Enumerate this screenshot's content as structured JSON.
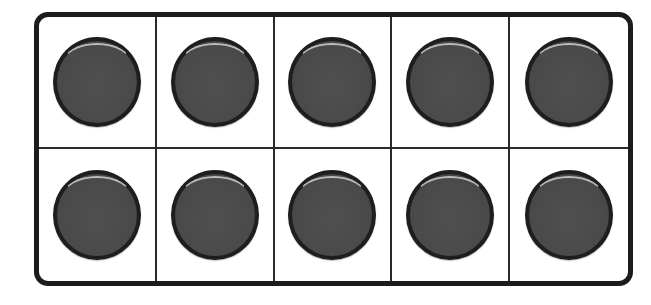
{
  "ten_frame": {
    "rows": 2,
    "columns": 5,
    "filled_count": 10,
    "total_cells": 10,
    "counter_color": "#4a4a4a",
    "counter_border_color": "#1e1e1e",
    "frame_border_color": "#1c1c1c",
    "cells": [
      {
        "row": 1,
        "col": 1,
        "filled": true
      },
      {
        "row": 1,
        "col": 2,
        "filled": true
      },
      {
        "row": 1,
        "col": 3,
        "filled": true
      },
      {
        "row": 1,
        "col": 4,
        "filled": true
      },
      {
        "row": 1,
        "col": 5,
        "filled": true
      },
      {
        "row": 2,
        "col": 1,
        "filled": true
      },
      {
        "row": 2,
        "col": 2,
        "filled": true
      },
      {
        "row": 2,
        "col": 3,
        "filled": true
      },
      {
        "row": 2,
        "col": 4,
        "filled": true
      },
      {
        "row": 2,
        "col": 5,
        "filled": true
      }
    ]
  }
}
